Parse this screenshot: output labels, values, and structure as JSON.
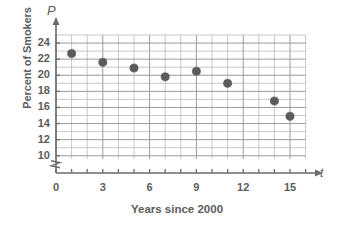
{
  "chart_data": {
    "type": "scatter",
    "title": "",
    "xlabel": "Years since 2000",
    "ylabel": "Percent of Smokers",
    "x_axis_variable": "t",
    "y_axis_variable": "P",
    "xlim": [
      0,
      16
    ],
    "ylim": [
      9,
      25
    ],
    "y_axis_broken": true,
    "y_axis_break_note": "zigzag break below 10",
    "grid": true,
    "grid_x_step": 1,
    "grid_y_step": 1,
    "legend": "none",
    "x_ticks": [
      "0",
      "3",
      "6",
      "9",
      "12",
      "15"
    ],
    "x_tick_values": [
      0,
      3,
      6,
      9,
      12,
      15
    ],
    "y_ticks": [
      "10",
      "12",
      "14",
      "16",
      "18",
      "20",
      "22",
      "24"
    ],
    "y_tick_values": [
      10,
      12,
      14,
      16,
      18,
      20,
      22,
      24
    ],
    "x": [
      1,
      3,
      5,
      7,
      9,
      11,
      14,
      15
    ],
    "values": [
      22.7,
      21.6,
      20.9,
      19.8,
      20.5,
      19.0,
      16.8,
      14.9
    ],
    "points": [
      {
        "t": 1,
        "p": 22.7
      },
      {
        "t": 3,
        "p": 21.6
      },
      {
        "t": 5,
        "p": 20.9
      },
      {
        "t": 7,
        "p": 19.8
      },
      {
        "t": 9,
        "p": 20.5
      },
      {
        "t": 11,
        "p": 19.0
      },
      {
        "t": 14,
        "p": 16.8
      },
      {
        "t": 15,
        "p": 14.9
      }
    ],
    "colors": {
      "dot": "#5b5b5b",
      "grid": "#b9b9b9",
      "axis": "#6b6b6b",
      "text": "#5c5c5c",
      "background": "#ffffff"
    }
  }
}
